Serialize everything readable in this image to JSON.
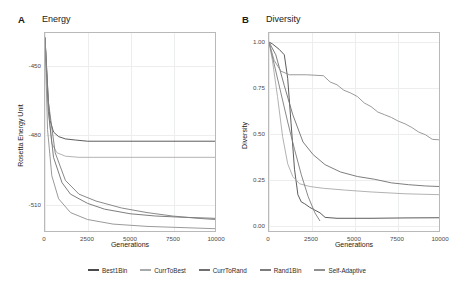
{
  "figure": {
    "panels": [
      {
        "label": "A",
        "title": "Energy",
        "xlabel": "Generations",
        "ylabel": "Rosetta Energy Unit"
      },
      {
        "label": "B",
        "title": "Diversity",
        "xlabel": "Generations",
        "ylabel": "Diversity"
      }
    ]
  },
  "legend": {
    "items": [
      {
        "label": "Best1Bin",
        "color": "#4a4a4a"
      },
      {
        "label": "CurrToBest",
        "color": "#a9a9a9"
      },
      {
        "label": "CurrToRand",
        "color": "#6f6f6f"
      },
      {
        "label": "Rand1Bin",
        "color": "#7c7c7c"
      },
      {
        "label": "Self-Adaptive",
        "color": "#8f8f8f"
      }
    ]
  },
  "chart_data": [
    {
      "type": "line",
      "panel": "A",
      "title": "Energy",
      "xlabel": "Generations",
      "ylabel": "Rosetta Energy Unit",
      "xlim": [
        0,
        10000
      ],
      "ylim": [
        -522,
        -436
      ],
      "xticks": [
        0,
        2500,
        5000,
        7500,
        10000
      ],
      "xticklabels": [
        "0",
        "2500",
        "5000",
        "7500",
        "10000"
      ],
      "yticks": [
        -450,
        -480,
        -510
      ],
      "yticklabels": [
        "-450",
        "-480",
        "-510"
      ],
      "grid": true,
      "legend_position": "bottom",
      "series": [
        {
          "name": "Best1Bin",
          "color": "#4a4a4a",
          "x": [
            0,
            100,
            200,
            300,
            500,
            800,
            1200,
            1800,
            2500,
            4000,
            6000,
            8000,
            10000
          ],
          "y": [
            -438,
            -452,
            -466,
            -474,
            -479,
            -481,
            -482,
            -482.5,
            -483,
            -483,
            -483,
            -483,
            -483
          ]
        },
        {
          "name": "CurrToBest",
          "color": "#a9a9a9",
          "x": [
            0,
            100,
            200,
            400,
            700,
            1200,
            2000,
            3000,
            5000,
            7000,
            10000
          ],
          "y": [
            -438,
            -455,
            -470,
            -484,
            -488,
            -489.5,
            -490,
            -490,
            -490,
            -490,
            -490
          ]
        },
        {
          "name": "CurrToRand",
          "color": "#6f6f6f",
          "x": [
            0,
            200,
            500,
            1000,
            1500,
            2500,
            3500,
            5000,
            6500,
            8000,
            10000
          ],
          "y": [
            -438,
            -470,
            -490,
            -501,
            -506,
            -510,
            -512.5,
            -514.5,
            -515.5,
            -516,
            -516.5
          ]
        },
        {
          "name": "Rand1Bin",
          "color": "#7c7c7c",
          "x": [
            0,
            200,
            600,
            1200,
            2000,
            3000,
            4500,
            6000,
            7500,
            9000,
            10000
          ],
          "y": [
            -438,
            -466,
            -488,
            -500,
            -506,
            -509,
            -512,
            -514,
            -515.5,
            -516.5,
            -517
          ]
        },
        {
          "name": "Self-Adaptive",
          "color": "#8f8f8f",
          "x": [
            0,
            150,
            400,
            800,
            1500,
            2500,
            4000,
            6000,
            8000,
            10000
          ],
          "y": [
            -438,
            -478,
            -498,
            -508,
            -514,
            -517,
            -519,
            -520,
            -520.5,
            -521
          ]
        }
      ]
    },
    {
      "type": "line",
      "panel": "B",
      "title": "Diversity",
      "xlabel": "Generations",
      "ylabel": "Diversity",
      "xlim": [
        0,
        10000
      ],
      "ylim": [
        -0.04,
        1.05
      ],
      "xticks": [
        0,
        2500,
        5000,
        7500,
        10000
      ],
      "xticklabels": [
        "0",
        "2500",
        "5000",
        "7500",
        "10000"
      ],
      "yticks": [
        0.0,
        0.25,
        0.5,
        0.75,
        1.0
      ],
      "yticklabels": [
        "0.00",
        "0.25",
        "0.50",
        "0.75",
        "1.00"
      ],
      "grid": true,
      "legend_position": "bottom",
      "series": [
        {
          "name": "Best1Bin",
          "color": "#4a4a4a",
          "x": [
            0,
            200,
            600,
            900,
            1100,
            1300,
            1500,
            1700,
            1900,
            2100,
            2400,
            2700,
            3000,
            3300,
            4000,
            6000,
            8000,
            10000
          ],
          "y": [
            1.0,
            0.99,
            0.96,
            0.93,
            0.8,
            0.55,
            0.3,
            0.16,
            0.12,
            0.11,
            0.09,
            0.075,
            0.06,
            0.035,
            0.03,
            0.03,
            0.032,
            0.033
          ]
        },
        {
          "name": "CurrToBest",
          "color": "#a9a9a9",
          "x": [
            0,
            200,
            500,
            800,
            1100,
            1400,
            1800,
            2400,
            3200,
            4500,
            6000,
            8000,
            10000
          ],
          "y": [
            1.0,
            0.9,
            0.7,
            0.48,
            0.33,
            0.26,
            0.22,
            0.205,
            0.195,
            0.185,
            0.175,
            0.165,
            0.16
          ]
        },
        {
          "name": "CurrToRand",
          "color": "#6f6f6f",
          "x": [
            0,
            400,
            900,
            1400,
            2000,
            2600,
            3300,
            4200,
            5200,
            6200,
            7200,
            8200,
            9200,
            10000
          ],
          "y": [
            1.0,
            0.93,
            0.76,
            0.6,
            0.45,
            0.38,
            0.325,
            0.285,
            0.26,
            0.245,
            0.225,
            0.215,
            0.208,
            0.205
          ]
        },
        {
          "name": "Rand1Bin",
          "color": "#7c7c7c",
          "x": [
            0,
            300,
            700,
            1100,
            1500,
            1900,
            2300,
            2700,
            3000
          ],
          "y": [
            1.0,
            0.88,
            0.72,
            0.56,
            0.41,
            0.27,
            0.15,
            0.06,
            0.015
          ]
        },
        {
          "name": "Self-Adaptive",
          "color": "#8f8f8f",
          "x": [
            0,
            300,
            700,
            1200,
            2200,
            3200,
            3600,
            4000,
            4400,
            4800,
            5200,
            5600,
            6000,
            6400,
            6800,
            7200,
            7600,
            8000,
            8400,
            8800,
            9200,
            9600,
            10000
          ],
          "y": [
            1.0,
            0.9,
            0.84,
            0.82,
            0.82,
            0.815,
            0.78,
            0.765,
            0.735,
            0.72,
            0.7,
            0.665,
            0.645,
            0.615,
            0.6,
            0.585,
            0.565,
            0.55,
            0.53,
            0.505,
            0.49,
            0.465,
            0.462
          ]
        }
      ]
    }
  ]
}
